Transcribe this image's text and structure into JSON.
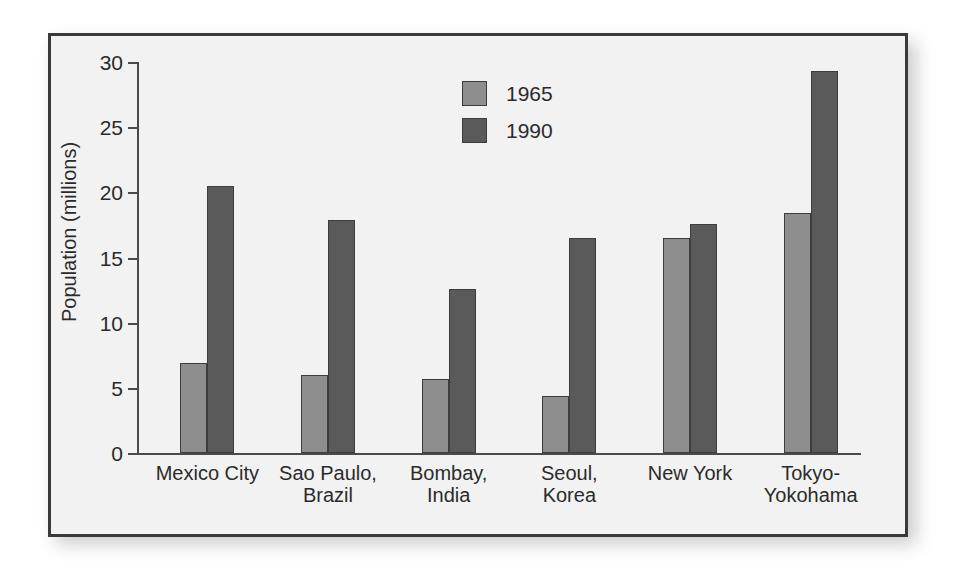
{
  "chart_data": {
    "type": "bar",
    "title": "",
    "xlabel": "",
    "ylabel": "Population (millions)",
    "ylim": [
      0,
      30
    ],
    "yticks": [
      0,
      5,
      10,
      15,
      20,
      25,
      30
    ],
    "ytick_labels": [
      "0",
      "5",
      "10",
      "15",
      "20",
      "25",
      "30"
    ],
    "grid": false,
    "legend_position": "upper center",
    "categories": [
      "Mexico City",
      "Sao Paulo,\nBrazil",
      "Bombay,\nIndia",
      "Seoul,\nKorea",
      "New York",
      "Tokyo-\nYokohama"
    ],
    "series": [
      {
        "name": "1965",
        "color": "#8e8e8e",
        "values": [
          6.9,
          6.0,
          5.7,
          4.4,
          16.5,
          18.4
        ]
      },
      {
        "name": "1990",
        "color": "#5a5a5a",
        "values": [
          20.5,
          17.9,
          12.6,
          16.5,
          17.6,
          29.3
        ]
      }
    ]
  },
  "figure": {
    "background_color": "#ffffff",
    "plot_background_color": "#f2f2f2",
    "frame_color": "#3a3a3a",
    "axis_color": "#4a4a4a",
    "text_color": "#2b2b2b"
  }
}
